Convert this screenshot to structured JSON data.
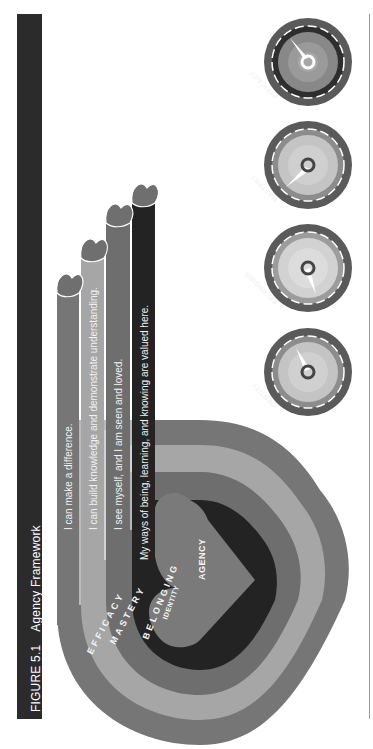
{
  "figure": {
    "number": "FIGURE 5.1",
    "title": "Agency Framework",
    "orientation": "rotated -90deg (reads bottom-to-top)"
  },
  "center": {
    "label": "AGENCY"
  },
  "rings": [
    {
      "id": "identity",
      "label": "IDENTITY",
      "statement": "My ways of being, learning, and knowing are valued here.",
      "color": "#232323"
    },
    {
      "id": "belonging",
      "label": "BELONGING",
      "statement": "I see myself, and I am seen and loved.",
      "color": "#6e6e6e"
    },
    {
      "id": "mastery",
      "label": "MASTERY",
      "statement": "I can build knowledge and demonstrate understanding.",
      "color": "#a6a6a6"
    },
    {
      "id": "efficacy",
      "label": "EFFICACY",
      "statement": "I can make a difference.",
      "color": "#767676"
    }
  ],
  "gauges": [
    {
      "label": "EFFICACY",
      "needle_angle_deg": -30
    },
    {
      "label": "MASTERY",
      "needle_angle_deg": -130
    },
    {
      "label": "BELONGING",
      "needle_angle_deg": 160
    },
    {
      "label": "IDENTITY",
      "needle_angle_deg": -25
    }
  ],
  "colors": {
    "heart_center": "#7a7a7a",
    "title_bar": "#2b2b2b",
    "heart_tip": "#6f6f6f"
  }
}
